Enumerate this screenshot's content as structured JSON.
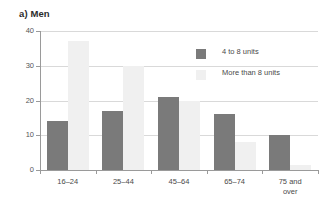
{
  "chart_data": {
    "type": "bar",
    "title": "a) Men",
    "xlabel": "",
    "ylabel": "",
    "ylim": [
      0,
      40
    ],
    "yticks": [
      0,
      10,
      20,
      30,
      40
    ],
    "ytick_labels": [
      "0",
      "10",
      "20",
      "30",
      "40"
    ],
    "grid": true,
    "legend_position": "top-right-inside",
    "categories": [
      "16–24",
      "25–44",
      "45–64",
      "65–74",
      "75 and\nover"
    ],
    "series": [
      {
        "name": "4 to 8 units",
        "color": "#7a7a7a",
        "values": [
          14,
          17,
          21,
          16,
          10
        ]
      },
      {
        "name": "More than 8 units",
        "color": "#f0f0f0",
        "values": [
          37,
          30,
          20,
          8,
          1.5
        ]
      }
    ]
  },
  "legend": {
    "items": [
      {
        "label": "4 to 8 units",
        "swatch": "dark"
      },
      {
        "label": "More than 8 units",
        "swatch": "light"
      }
    ]
  }
}
